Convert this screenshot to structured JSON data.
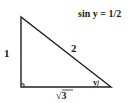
{
  "diagram": {
    "title": "sin y = 1/2",
    "sides": {
      "vertical": "1",
      "hypotenuse": "2",
      "horizontal": "√3"
    },
    "angle_label": "y",
    "right_angle_marker": true,
    "colors": {
      "line": "#222222",
      "background": "#ffffff"
    }
  }
}
